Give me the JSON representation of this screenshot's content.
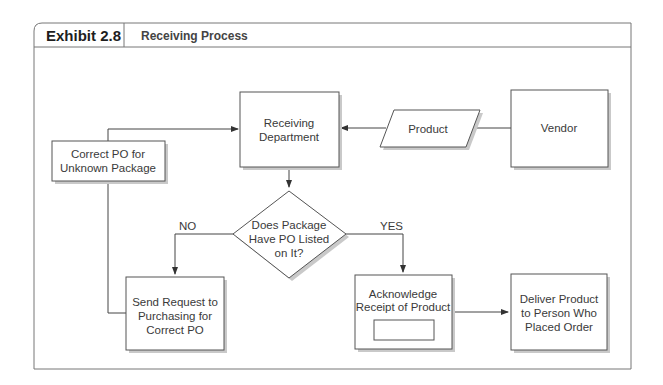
{
  "header": {
    "exhibit_label": "Exhibit 2.8",
    "title": "Receiving Process"
  },
  "nodes": {
    "receiving_department": {
      "line1": "Receiving",
      "line2": "Department",
      "shape": "rectangle"
    },
    "product": {
      "line1": "Product",
      "shape": "parallelogram"
    },
    "vendor": {
      "line1": "Vendor",
      "shape": "rectangle"
    },
    "correct_po": {
      "line1": "Correct PO for",
      "line2": "Unknown Package",
      "shape": "rectangle"
    },
    "decision": {
      "line1": "Does Package",
      "line2": "Have PO Listed",
      "line3": "on It?",
      "shape": "diamond"
    },
    "send_request": {
      "line1": "Send Request to",
      "line2": "Purchasing for",
      "line3": "Correct PO",
      "shape": "rectangle"
    },
    "acknowledge": {
      "line1": "Acknowledge",
      "line2": "Receipt of Product",
      "shape": "rectangle-with-inner-box"
    },
    "deliver": {
      "line1": "Deliver Product",
      "line2": "to Person Who",
      "line3": "Placed Order",
      "shape": "rectangle"
    }
  },
  "edges": [
    {
      "from": "vendor",
      "to": "product",
      "label": ""
    },
    {
      "from": "product",
      "to": "receiving_department",
      "label": ""
    },
    {
      "from": "receiving_department",
      "to": "decision",
      "label": ""
    },
    {
      "from": "decision",
      "to": "send_request",
      "label": "NO"
    },
    {
      "from": "decision",
      "to": "acknowledge",
      "label": "YES"
    },
    {
      "from": "send_request",
      "to": "correct_po",
      "label": ""
    },
    {
      "from": "correct_po",
      "to": "receiving_department",
      "label": ""
    },
    {
      "from": "acknowledge",
      "to": "deliver",
      "label": ""
    }
  ],
  "edge_labels": {
    "no": "NO",
    "yes": "YES"
  },
  "colors": {
    "stroke": "#555555",
    "shadow": "#bdbdbd",
    "text": "#3a3a3a",
    "frame": "#777777"
  }
}
